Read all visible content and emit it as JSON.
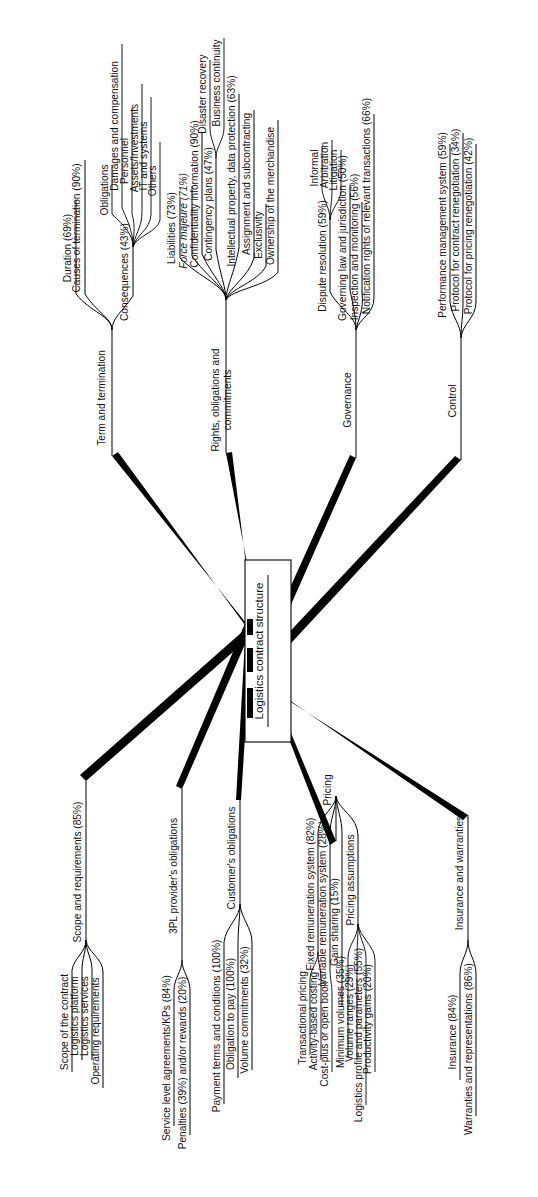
{
  "figure": {
    "type": "mind-map",
    "orientation": "rotated-90-ccw",
    "root": "Logistics contract structure",
    "background_color": "#ffffff",
    "line_color": "#000000",
    "text_color": "#111111"
  },
  "root": {
    "label": "Logistics contract structure"
  },
  "branches": [
    {
      "id": "term-and-termination",
      "label": "Term and termination",
      "children": [
        {
          "label": "Duration (69%)"
        },
        {
          "label": "Causes of termination (90%)"
        },
        {
          "label": "Consequences (43%)",
          "children": [
            {
              "label": "Obligations"
            },
            {
              "label": "Damages and compensation"
            },
            {
              "label": "Personnel"
            },
            {
              "label": "Assets/Investments"
            },
            {
              "label": "IT and systems"
            },
            {
              "label": "Others"
            }
          ]
        }
      ]
    },
    {
      "id": "rights-obligations-and-commitments",
      "label": "Rights, obligations and commitments",
      "children": [
        {
          "label": "Liabilities (73%)"
        },
        {
          "label": "Force majeure (71%)",
          "italic": true
        },
        {
          "label": "Confidentiality information (90%)"
        },
        {
          "label": "Contingency plans (47%)",
          "children": [
            {
              "label": "Disaster recovery"
            },
            {
              "label": "Business continuity"
            }
          ]
        },
        {
          "label": "Intellectual property, data protection (63%)"
        },
        {
          "label": "Assignment and subcontracting"
        },
        {
          "label": "Exclusivity"
        },
        {
          "label": "Ownership of the merchandise"
        }
      ]
    },
    {
      "id": "governance",
      "label": "Governance",
      "children": [
        {
          "label": "Dispute resolution (59%)",
          "children": [
            {
              "label": "Informal"
            },
            {
              "label": "Arbitration"
            },
            {
              "label": "Litigation"
            }
          ]
        },
        {
          "label": "Governing law and jurisdiction (50%)"
        },
        {
          "label": "Inspection and monitoring (56%)"
        },
        {
          "label": "Notification rights of relevant transactions (66%)"
        }
      ]
    },
    {
      "id": "control",
      "label": "Control",
      "children": [
        {
          "label": "Performance management system (59%)"
        },
        {
          "label": "Protocol for contract renegotiation (34%)"
        },
        {
          "label": "Protocol for pricing renegotiation (42%)"
        }
      ]
    },
    {
      "id": "scope-and-requirements",
      "label": "Scope and requirements (85%)",
      "children": [
        {
          "label": "Scope of the contract"
        },
        {
          "label": "Logistics platform"
        },
        {
          "label": "Logistics services"
        },
        {
          "label": "Operating requirements"
        }
      ]
    },
    {
      "id": "3pl-providers-obligations",
      "label": "3PL provider's obligations",
      "children": [
        {
          "label": "Service level agreements/KPs (84%)"
        },
        {
          "label": "Penalties (39%) and/or rewards (20%)"
        }
      ]
    },
    {
      "id": "customers-obligations",
      "label": "Customer's obligations",
      "children": [
        {
          "label": "Payment terms and conditions (100%)"
        },
        {
          "label": "Obligation to pay (100%)"
        },
        {
          "label": "Volume commitments (32%)"
        }
      ]
    },
    {
      "id": "pricing",
      "label": "Pricing",
      "children": [
        {
          "label": "Fixed remuneration system (82%)",
          "children": [
            {
              "label": "Transactional pricing"
            },
            {
              "label": "Activity-based costing"
            }
          ]
        },
        {
          "label": "Variable remuneration system (28%)",
          "children": [
            {
              "label": "Cost-plus or open book"
            }
          ]
        },
        {
          "label": "Gain sharing (15%)"
        },
        {
          "label": "Pricing assumptions",
          "children": [
            {
              "label": "Minimum volumes (35%)"
            },
            {
              "label": "Volume ranges (29%)"
            },
            {
              "label": "Logistics profile and parameters (55%)"
            },
            {
              "label": "Productivity gains (20%)"
            }
          ]
        }
      ]
    },
    {
      "id": "insurance-and-warranties",
      "label": "Insurance and warranties",
      "children": [
        {
          "label": "Insurance (84%)"
        },
        {
          "label": "Warranties and representations (86%)"
        }
      ]
    }
  ],
  "labels": {
    "root": "Logistics contract structure",
    "term_and_termination": "Term and termination",
    "duration": "Duration (69%)",
    "causes_of_termination": "Causes of termination (90%)",
    "consequences": "Consequences (43%)",
    "obligations": "Obligations",
    "damages_and_compensation": "Damages and compensation",
    "personnel": "Personnel",
    "assets_investments": "Assets/Investments",
    "it_and_systems": "IT and systems",
    "others": "Others",
    "rights_obligations_and_commitments_1": "Rights, obligations and",
    "rights_obligations_and_commitments_2": "commitments",
    "liabilities": "Liabilities (73%)",
    "force_majeure": "Force majeure (71%)",
    "confidentiality_information": "Confidentiality information (90%)",
    "contingency_plans": "Contingency plans (47%)",
    "disaster_recovery": "Disaster recovery",
    "business_continuity": "Business continuity",
    "intellectual_property": "Intellectual property, data protection (63%)",
    "assignment_and_subcontracting": "Assignment and subcontracting",
    "exclusivity": "Exclusivity",
    "ownership_of_the_merchandise": "Ownership of the merchandise",
    "governance": "Governance",
    "dispute_resolution": "Dispute resolution (59%)",
    "informal": "Informal",
    "arbitration": "Arbitration",
    "litigation": "Litigation",
    "governing_law": "Governing law and jurisdiction (50%)",
    "inspection_and_monitoring": "Inspection and monitoring (56%)",
    "notification_rights": "Notification rights of relevant transactions (66%)",
    "control": "Control",
    "performance_management_system": "Performance management system (59%)",
    "protocol_contract_renegotiation": "Protocol for contract renegotiation (34%)",
    "protocol_pricing_renegotiation": "Protocol for pricing renegotiation (42%)",
    "scope_and_requirements": "Scope and requirements (85%)",
    "scope_of_the_contract": "Scope of the contract",
    "logistics_platform": "Logistics platform",
    "logistics_services": "Logistics services",
    "operating_requirements": "Operating requirements",
    "provider_obligations": "3PL provider's obligations",
    "sla_kps": "Service level agreements/KPs (84%)",
    "penalties_rewards": "Penalties (39%) and/or rewards (20%)",
    "customer_obligations": "Customer's obligations",
    "payment_terms": "Payment terms and conditions (100%)",
    "obligation_to_pay": "Obligation to pay (100%)",
    "volume_commitments": "Volume commitments (32%)",
    "pricing": "Pricing",
    "fixed_remuneration": "Fixed remuneration system (82%)",
    "transactional_pricing": "Transactional pricing",
    "activity_based_costing": "Activity-based costing",
    "variable_remuneration": "Variable remuneration system (28%)",
    "cost_plus_open_book": "Cost-plus or open book",
    "gain_sharing": "Gain sharing (15%)",
    "pricing_assumptions": "Pricing assumptions",
    "minimum_volumes": "Minimum volumes (35%)",
    "volume_ranges": "Volume ranges (29%)",
    "logistics_profile": "Logistics profile and parameters (55%)",
    "productivity_gains": "Productivity gains (20%)",
    "insurance_and_warranties": "Insurance and warranties",
    "insurance": "Insurance (84%)",
    "warranties_and_representations": "Warranties and representations (86%)"
  }
}
